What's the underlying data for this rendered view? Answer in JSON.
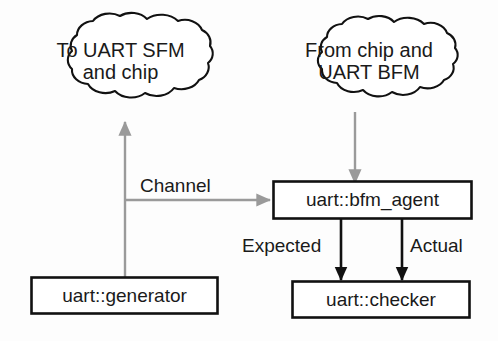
{
  "diagram": {
    "background_color": "#fdfdfd",
    "black": "#111111",
    "gray": "#9a9a9a",
    "nodes": {
      "cloud_left": {
        "shape": "cloud",
        "label": "To UART SFM\nand chip",
        "line_1": "To UART SFM",
        "line_2": "and chip"
      },
      "cloud_right": {
        "shape": "cloud",
        "label": "From chip and\nUART BFM",
        "line_1": "From chip and",
        "line_2": "UART BFM"
      },
      "bfm_agent": {
        "shape": "rectangle",
        "label": "uart::bfm_agent"
      },
      "generator": {
        "shape": "rectangle",
        "label": "uart::generator"
      },
      "checker": {
        "shape": "rectangle",
        "label": "uart::checker"
      }
    },
    "edges": {
      "generator_to_cloud_left": {
        "label": "",
        "color": "#9a9a9a",
        "from": "uart::generator",
        "to": "To UART SFM and chip"
      },
      "generator_to_bfm_agent": {
        "label": "Channel",
        "color": "#9a9a9a",
        "from": "uart::generator",
        "to": "uart::bfm_agent"
      },
      "cloud_right_to_bfm_agent": {
        "label": "",
        "color": "#9a9a9a",
        "from": "From chip and UART BFM",
        "to": "uart::bfm_agent"
      },
      "bfm_agent_to_checker_expected": {
        "label": "Expected",
        "color": "#111111",
        "from": "uart::bfm_agent",
        "to": "uart::checker"
      },
      "bfm_agent_to_checker_actual": {
        "label": "Actual",
        "color": "#111111",
        "from": "uart::bfm_agent",
        "to": "uart::checker"
      }
    }
  }
}
